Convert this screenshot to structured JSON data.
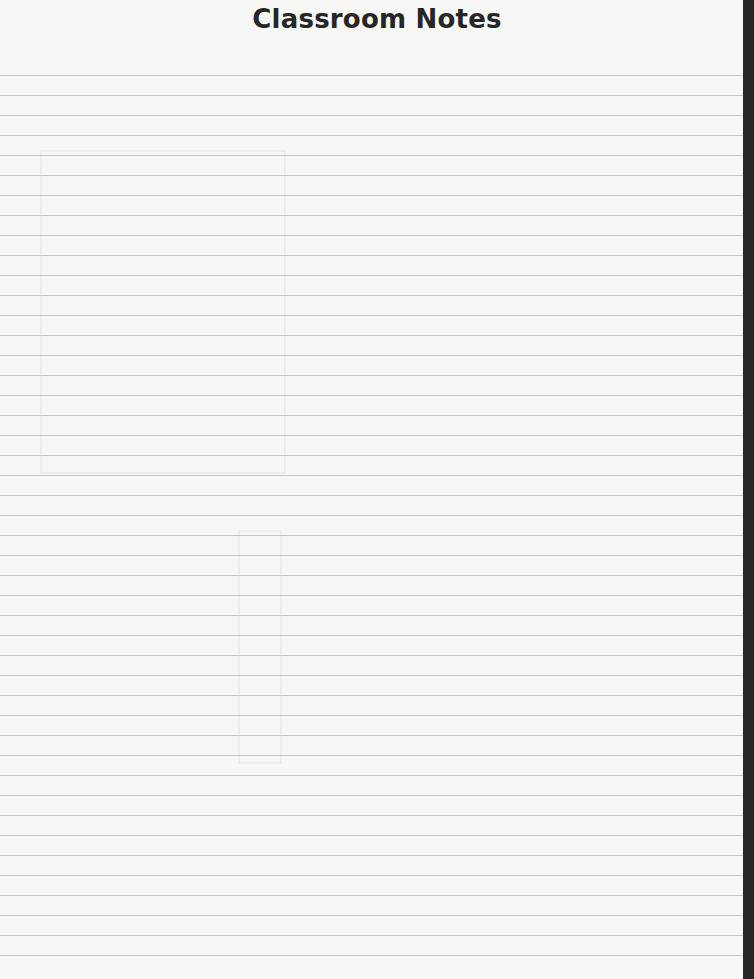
{
  "page": {
    "title": "Classroom Notes",
    "ruled_lines": {
      "first_y": 75,
      "spacing": 20,
      "count": 45,
      "color": "#c8c8c8"
    },
    "background_color": "#f7f7f6",
    "edge_color": "#262626"
  }
}
